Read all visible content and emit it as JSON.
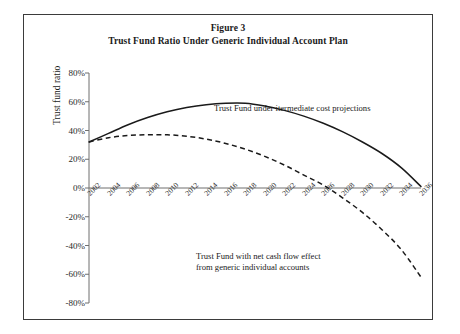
{
  "figure": {
    "title_line1": "Figure 3",
    "title_line2": "Trust Fund Ratio Under Generic Individual Account Plan"
  },
  "axes": {
    "y_title": "Trust fund ratio",
    "y_ticks": [
      "80%",
      "60%",
      "40%",
      "20%",
      "0%",
      "-20%",
      "-40%",
      "-60%",
      "-80%"
    ],
    "x_ticks": [
      "2002",
      "2004",
      "2006",
      "2008",
      "2010",
      "2012",
      "2014",
      "2016",
      "2018",
      "2020",
      "2022",
      "2024",
      "2026",
      "2028",
      "2030",
      "2032",
      "2034",
      "2036"
    ]
  },
  "annotations": {
    "solid": "Trust Fund under itermediate cost projections",
    "dashed_line1": "Trust Fund with net cash flow effect",
    "dashed_line2": "from generic individual accounts"
  },
  "colors": {
    "line": "#1a1a1a",
    "axis": "#6f6f6f",
    "frame": "#3b3b3b",
    "background": "#ffffff"
  },
  "chart_data": {
    "type": "line",
    "title": "Trust Fund Ratio Under Generic Individual Account Plan",
    "subtitle": "Figure 3",
    "xlabel": "",
    "ylabel": "Trust fund ratio",
    "xlim": [
      2002,
      2036
    ],
    "ylim": [
      -80,
      80
    ],
    "ytick_values": [
      80,
      60,
      40,
      20,
      0,
      -20,
      -40,
      -60,
      -80
    ],
    "ytick_format": "percent",
    "x": [
      2002,
      2004,
      2006,
      2008,
      2010,
      2012,
      2014,
      2016,
      2018,
      2020,
      2022,
      2024,
      2026,
      2028,
      2030,
      2032,
      2034,
      2036
    ],
    "grid": false,
    "legend": "annotations-inline",
    "series": [
      {
        "name": "Trust Fund under itermediate cost projections",
        "style": "solid",
        "values": [
          32,
          38,
          44,
          49,
          53,
          56,
          58,
          59,
          59,
          57,
          54,
          50,
          45,
          39,
          32,
          24,
          14,
          1
        ]
      },
      {
        "name": "Trust Fund with net cash flow effect from generic individual accounts",
        "style": "dashed",
        "values": [
          32,
          35,
          36.5,
          37,
          37,
          36,
          34,
          31,
          27,
          22,
          16,
          9,
          2,
          -7,
          -17,
          -29,
          -43,
          -62
        ],
        "x_end": 2036
      }
    ]
  }
}
